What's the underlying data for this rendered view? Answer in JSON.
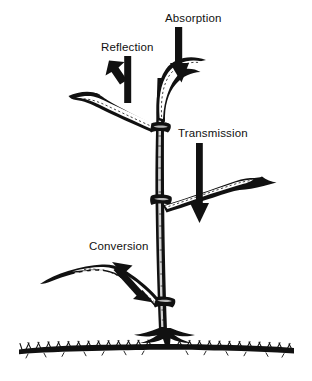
{
  "figure": {
    "background_color": "#ffffff",
    "ink_color": "#000000",
    "labels": [
      {
        "id": "absorption",
        "text": "Absorption",
        "x": 165,
        "y": 22,
        "anchor": "start"
      },
      {
        "id": "reflection",
        "text": "Reflection",
        "x": 101,
        "y": 51,
        "anchor": "start"
      },
      {
        "id": "transmission",
        "text": "Transmission",
        "x": 178,
        "y": 137,
        "anchor": "start"
      },
      {
        "id": "conversion",
        "text": "Conversion",
        "x": 89,
        "y": 250,
        "anchor": "start"
      }
    ],
    "arrows": [
      {
        "id": "absorption-arrow",
        "direction": "down",
        "heads": 1,
        "label": "Absorption"
      },
      {
        "id": "reflection-arrow",
        "direction": "up-left",
        "heads": 1,
        "label": "Reflection"
      },
      {
        "id": "transmission-arrow",
        "direction": "down",
        "heads": 1,
        "label": "Transmission"
      },
      {
        "id": "conversion-arrow",
        "direction": "bidirectional-diagonal",
        "heads": 2,
        "label": "Conversion"
      }
    ],
    "plant": {
      "stem_label": "upright stem with nodes",
      "leaves": [
        {
          "id": "leaf-top",
          "position": "top, curving right from apex"
        },
        {
          "id": "leaf-upper-left",
          "position": "upper left, angled down-left"
        },
        {
          "id": "leaf-middle-right",
          "position": "middle right, angled up-right"
        },
        {
          "id": "leaf-lower-left",
          "position": "lower left, angled up-left"
        }
      ],
      "ground_label": "soil surface with grass hatching"
    }
  }
}
